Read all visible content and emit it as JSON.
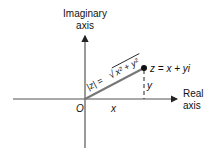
{
  "diagram": {
    "imag_axis_label_line1": "Imaginary",
    "imag_axis_label_line2": "axis",
    "real_axis_label_line1": "Real",
    "real_axis_label_line2": "axis",
    "origin_label": "O",
    "x_label": "x",
    "y_label": "y",
    "point_label": "z = x + yi",
    "modulus_label": "|z| = √(x² + y²)",
    "modulus_lhs": "|z| =",
    "modulus_radicand": "x² + y²",
    "colors": {
      "ink": "#111111",
      "vector": "#666666",
      "axes": "#555555"
    }
  }
}
